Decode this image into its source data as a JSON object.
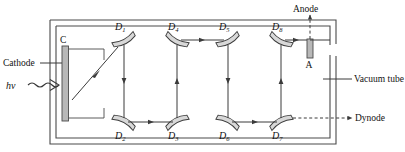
{
  "figure": {
    "type": "photomultiplier-tube-schematic",
    "title_visible": false,
    "colors": {
      "line": "#3a3a3a",
      "wall": "#4a4a4a",
      "electrode_fill": "#b8b8b8",
      "electrode_stroke": "#4a4a4a",
      "background": "#ffffff",
      "text": "#111111"
    }
  },
  "labels": {
    "cathode": "Cathode",
    "anode": "Anode",
    "vacuum_tube": "Vacuum tube",
    "dynode": "Dynode",
    "photon": "hv",
    "cathode_symbol": "C",
    "anode_symbol": "A"
  },
  "dynodes": [
    {
      "id": "D1",
      "base": "D",
      "sub": "1",
      "row": "top",
      "x": 124,
      "y": 40,
      "angle": -28
    },
    {
      "id": "D2",
      "base": "D",
      "sub": "2",
      "row": "bottom",
      "x": 124,
      "y": 122,
      "angle": 28
    },
    {
      "id": "D3",
      "base": "D",
      "sub": "3",
      "row": "bottom",
      "x": 177,
      "y": 122,
      "angle": -28
    },
    {
      "id": "D4",
      "base": "D",
      "sub": "4",
      "row": "top",
      "x": 177,
      "y": 40,
      "angle": 28
    },
    {
      "id": "D5",
      "base": "D",
      "sub": "5",
      "row": "top",
      "x": 228,
      "y": 40,
      "angle": -28
    },
    {
      "id": "D6",
      "base": "D",
      "sub": "6",
      "row": "bottom",
      "x": 228,
      "y": 122,
      "angle": 28
    },
    {
      "id": "D7",
      "base": "D",
      "sub": "7",
      "row": "bottom",
      "x": 281,
      "y": 122,
      "angle": -28
    },
    {
      "id": "D8",
      "base": "D",
      "sub": "8",
      "row": "top",
      "x": 281,
      "y": 40,
      "angle": 28
    }
  ],
  "electron_path": [
    {
      "from": "C",
      "to": "D1",
      "direction": "diagonal-up-right"
    },
    {
      "from": "D1",
      "to": "D2",
      "direction": "down"
    },
    {
      "from": "D2",
      "to": "D3",
      "direction": "right"
    },
    {
      "from": "D3",
      "to": "D4",
      "direction": "up"
    },
    {
      "from": "D4",
      "to": "D5",
      "direction": "right"
    },
    {
      "from": "D5",
      "to": "D6",
      "direction": "down"
    },
    {
      "from": "D6",
      "to": "D7",
      "direction": "right"
    },
    {
      "from": "D7",
      "to": "D8",
      "direction": "up"
    },
    {
      "from": "D8",
      "to": "A",
      "direction": "right"
    }
  ]
}
